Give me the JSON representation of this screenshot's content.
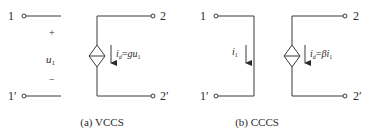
{
  "circuits": [
    {
      "id": "vccs",
      "caption": "(a) VCCS",
      "terminal_in_top": "1",
      "terminal_in_bottom": "1′",
      "terminal_out_top": "2",
      "terminal_out_bottom": "2′",
      "control_plus": "+",
      "control_minus": "−",
      "control_var": "u",
      "control_sub": "1",
      "source_current_var": "i",
      "source_current_sub": "d",
      "source_eq": "=",
      "source_gain": "gu",
      "source_gain_sub": "1"
    },
    {
      "id": "cccs",
      "caption": "(b) CCCS",
      "terminal_in_top": "1",
      "terminal_in_bottom": "1′",
      "terminal_out_top": "2",
      "terminal_out_bottom": "2′",
      "control_var": "i",
      "control_sub": "1",
      "source_current_var": "i",
      "source_current_sub": "d",
      "source_eq": "=",
      "source_gain": "βi",
      "source_gain_sub": "1"
    }
  ],
  "colors": {
    "stroke": "#3a3a3a",
    "text": "#2a2a2a",
    "background": "#ffffff"
  }
}
